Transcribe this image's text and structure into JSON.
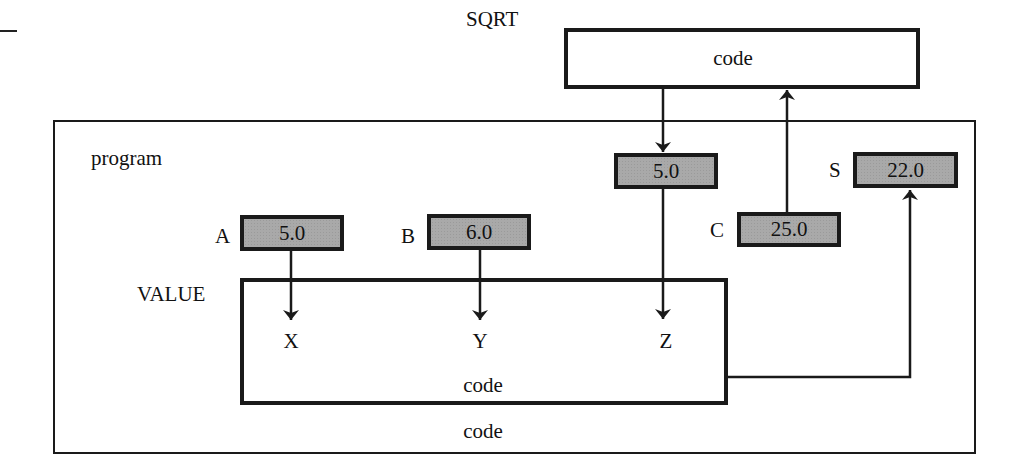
{
  "diagram": {
    "type": "procedure-call parameter passing diagram",
    "top_left_mark": "—",
    "sqrt": {
      "name": "SQRT",
      "code_label": "code"
    },
    "program": {
      "name": "program",
      "code_label": "code",
      "variables": [
        {
          "name": "A",
          "value": "5.0"
        },
        {
          "name": "B",
          "value": "6.0"
        },
        {
          "name": "C",
          "value": "25.0"
        },
        {
          "name": "S",
          "value": "22.0"
        }
      ],
      "temp_cell": {
        "value": "5.0"
      }
    },
    "value_proc": {
      "name": "VALUE",
      "code_label": "code",
      "params": [
        "X",
        "Y",
        "Z"
      ]
    },
    "flows": [
      {
        "from": "A",
        "to": "X"
      },
      {
        "from": "B",
        "to": "Y"
      },
      {
        "from": "SQRT",
        "to": "temp_cell"
      },
      {
        "from": "temp_cell",
        "to": "Z"
      },
      {
        "from": "C",
        "to": "SQRT"
      },
      {
        "from": "VALUE",
        "to": "S"
      }
    ],
    "colors": {
      "line": "#1a1a1a",
      "cell_fill": "#a9a9a9",
      "background": "#ffffff"
    }
  }
}
